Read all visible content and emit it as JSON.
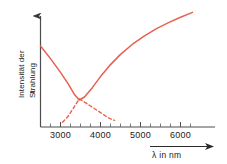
{
  "chart_data": {
    "type": "line",
    "title": "",
    "xlabel": "λ in nm",
    "ylabel_line1": "Intensität der",
    "ylabel_line2": "Strahlung",
    "xlim": [
      2500,
      6300
    ],
    "ylim": [
      0,
      1
    ],
    "grid": false,
    "legend": "none",
    "accent_color": "#e8604f",
    "axis_color": "#4d4d4d",
    "xticks": [
      3000,
      4000,
      5000,
      6000
    ],
    "xtick_labels": [
      "3000",
      "4000",
      "5000",
      "6000"
    ],
    "xminor_ticks": [
      2750,
      3250,
      3500,
      3750,
      4250,
      4500,
      4750,
      5250,
      5500,
      5750,
      6250
    ],
    "yticks": [],
    "ytick_labels": [],
    "series": [
      {
        "name": "resultierende Intensitaet",
        "style": "solid",
        "color": "#e8604f",
        "points": [
          [
            2500,
            0.675
          ],
          [
            2750,
            0.57
          ],
          [
            3000,
            0.455
          ],
          [
            3200,
            0.355
          ],
          [
            3350,
            0.27
          ],
          [
            3470,
            0.225
          ],
          [
            3600,
            0.25
          ],
          [
            3800,
            0.33
          ],
          [
            4000,
            0.42
          ],
          [
            4250,
            0.52
          ],
          [
            4500,
            0.605
          ],
          [
            4800,
            0.69
          ],
          [
            5100,
            0.76
          ],
          [
            5400,
            0.82
          ],
          [
            5700,
            0.87
          ],
          [
            6000,
            0.915
          ],
          [
            6300,
            0.955
          ]
        ]
      },
      {
        "name": "abfallende Teilkomponente",
        "style": "dashed",
        "color": "#e8604f",
        "points": [
          [
            3470,
            0.235
          ],
          [
            3750,
            0.175
          ],
          [
            4000,
            0.12
          ],
          [
            4200,
            0.075
          ],
          [
            4350,
            0.055
          ]
        ]
      },
      {
        "name": "ansteigende Teilkomponente",
        "style": "dashed",
        "color": "#e8604f",
        "points": [
          [
            3050,
            0.04
          ],
          [
            3180,
            0.085
          ],
          [
            3320,
            0.155
          ],
          [
            3470,
            0.235
          ]
        ]
      }
    ],
    "annotations": []
  }
}
